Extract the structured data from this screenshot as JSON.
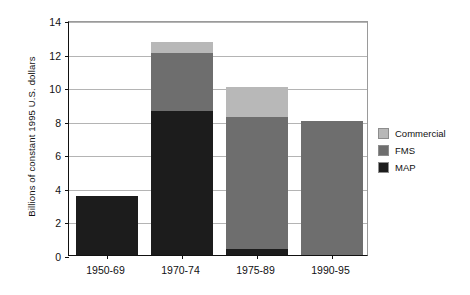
{
  "chart_data": {
    "type": "bar",
    "subtype": "stacked",
    "title": "",
    "xlabel": "",
    "ylabel": "Billions of constant 1995 U.S. dollars",
    "categories": [
      "1950-69",
      "1970-74",
      "1975-89",
      "1990-95"
    ],
    "series": [
      {
        "name": "MAP",
        "color": "#1c1c1c",
        "values": [
          3.5,
          8.6,
          0.35,
          0.0
        ]
      },
      {
        "name": "FMS",
        "color": "#6e6e6e",
        "values": [
          0.0,
          3.45,
          7.85,
          8.0
        ]
      },
      {
        "name": "Commercial",
        "color": "#b8b8b8",
        "values": [
          0.0,
          0.65,
          1.8,
          0.0
        ]
      }
    ],
    "totals": [
      3.5,
      12.7,
      10.0,
      8.0
    ],
    "ylim": [
      0,
      14
    ],
    "ytick_values": [
      0,
      2,
      4,
      6,
      8,
      10,
      12,
      14
    ],
    "ytick_labels": [
      "0",
      "2",
      "4",
      "6",
      "8",
      "10",
      "12",
      "14"
    ],
    "grid": true,
    "legend_position": "right",
    "legend_entries": [
      "Commercial",
      "FMS",
      "MAP"
    ]
  }
}
